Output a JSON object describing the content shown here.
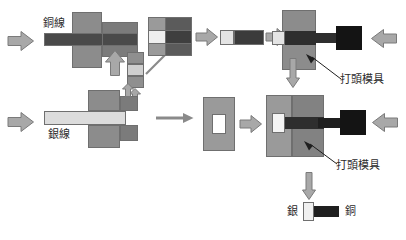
{
  "diagram": {
    "labels": {
      "copper_wire": "銅線",
      "silver_wire": "銀線",
      "heading_die_top": "打頭模具",
      "heading_die_bottom": "打頭模具",
      "product_silver": "銀",
      "product_copper": "銅"
    },
    "colors": {
      "wire_copper": "#4a4a4a",
      "wire_silver": "#dcdcdc",
      "die_body": "#8c8c8c",
      "die_dark": "#2e2e2e",
      "punch_black": "#1a1a1a",
      "arrow_fill": "#a8a8a8",
      "arrow_stroke": "#7a7a7a",
      "outline": "#6f6f6f",
      "text": "#2b2b2b",
      "cell_light": "#f2f2f2",
      "cell_mid": "#9a9a9a",
      "cell_dark": "#555555"
    },
    "grid_block": {
      "name": "cross-section-grid",
      "rows": 3,
      "cols": 2,
      "cells": [
        [
          "#9a9a9a",
          "#5b5b5b"
        ],
        [
          "#efefef",
          "#3f3f3f"
        ],
        [
          "#9a9a9a",
          "#5b5b5b"
        ]
      ]
    },
    "stack_block": {
      "name": "vertical-segment-stack",
      "cells": [
        "#8f8f8f",
        "#cfcfcf",
        "#8f8f8f"
      ]
    },
    "steps": [
      {
        "id": "copper-feed",
        "label": "銅線"
      },
      {
        "id": "copper-cut",
        "label": ""
      },
      {
        "id": "slug-transfer",
        "label": ""
      },
      {
        "id": "copper-slug",
        "label": ""
      },
      {
        "id": "copper-heading",
        "label": "打頭模具"
      },
      {
        "id": "silver-feed",
        "label": "銀線"
      },
      {
        "id": "silver-in-die",
        "label": ""
      },
      {
        "id": "combined-heading",
        "label": "打頭模具"
      },
      {
        "id": "finished-rivet",
        "label": "銀 / 銅"
      }
    ],
    "arrows": {
      "feed_right": "arrow-right",
      "push_up": "arrow-up",
      "push_down": "arrow-down",
      "punch_left": "arrow-left",
      "transfer": "arrow-diagonal"
    }
  }
}
